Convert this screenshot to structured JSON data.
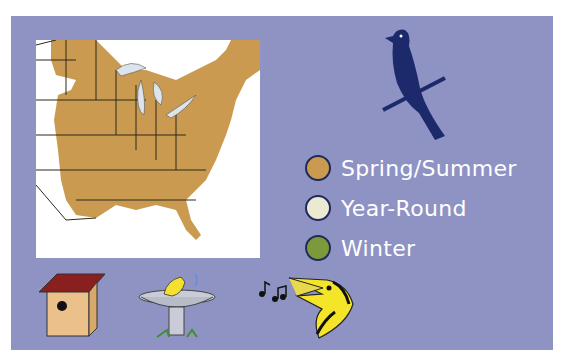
{
  "legend": {
    "items": [
      {
        "label": "Spring/Summer",
        "color": "#c99a50"
      },
      {
        "label": "Year-Round",
        "color": "#ece9d2"
      },
      {
        "label": "Winter",
        "color": "#7d9a3a"
      }
    ]
  },
  "colors": {
    "panel": "#8e93c4",
    "bird_silhouette": "#1c2a6b",
    "range": "#c99a50"
  },
  "icons": [
    "bird-silhouette-icon",
    "birdhouse-icon",
    "birdbath-icon",
    "singing-bird-icon",
    "music-notes-icon"
  ]
}
